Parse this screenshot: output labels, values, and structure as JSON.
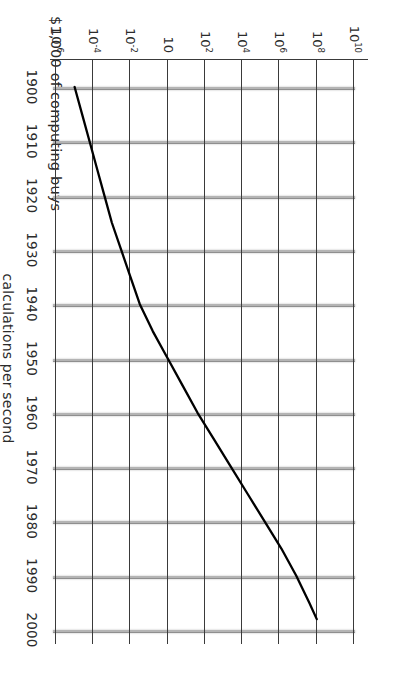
{
  "chart_data": {
    "type": "line",
    "title": "$1,000 of computing buys",
    "xlabel": "",
    "ylabel": "calculations per second",
    "x_ticks": [
      "1900",
      "1910",
      "1920",
      "1930",
      "1940",
      "1950",
      "1960",
      "1970",
      "1980",
      "1990",
      "2000"
    ],
    "y_ticks": [
      {
        "mantissa": "10",
        "exponent": "10"
      },
      {
        "mantissa": "10",
        "exponent": "8"
      },
      {
        "mantissa": "10",
        "exponent": "6"
      },
      {
        "mantissa": "10",
        "exponent": "4"
      },
      {
        "mantissa": "10",
        "exponent": "2"
      },
      {
        "mantissa": "10",
        "exponent": ""
      },
      {
        "mantissa": "10",
        "exponent": "-2"
      },
      {
        "mantissa": "10",
        "exponent": "-4"
      },
      {
        "mantissa": "10",
        "exponent": "-6"
      }
    ],
    "xlim": [
      1900,
      2000
    ],
    "ylim_log10": [
      -6,
      10
    ],
    "grid": true,
    "legend": false,
    "series": [
      {
        "name": "computing power per $1,000",
        "color": "#000000",
        "x": [
          1900,
          1905,
          1910,
          1915,
          1920,
          1925,
          1930,
          1935,
          1940,
          1945,
          1950,
          1955,
          1960,
          1965,
          1970,
          1975,
          1980,
          1985,
          1990,
          1995,
          1998
        ],
        "y_log10": [
          -5.0,
          -4.6,
          -4.2,
          -3.8,
          -3.4,
          -3.0,
          -2.5,
          -2.0,
          -1.5,
          -0.8,
          0.0,
          0.8,
          1.6,
          2.5,
          3.4,
          4.3,
          5.2,
          6.1,
          6.9,
          7.6,
          8.0
        ]
      }
    ],
    "colors": {
      "line": "#000000",
      "year_gridline": "#b4b4b4",
      "decade_gridline": "#3a3a3a",
      "text": "#2b2b2b",
      "background": "#ffffff"
    }
  }
}
